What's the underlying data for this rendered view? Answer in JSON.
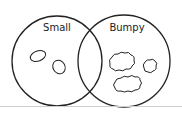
{
  "diagram": {
    "type": "venn",
    "sets": [
      {
        "label": "Small",
        "items": [
          "smooth small pebble",
          "smooth small pebble"
        ]
      },
      {
        "label": "Bumpy",
        "items": [
          "large bumpy rock",
          "small bumpy rock",
          "large bumpy rock"
        ]
      }
    ],
    "intersection_items": [],
    "colors": {
      "stroke": "#222222",
      "background": "#ffffff"
    }
  }
}
